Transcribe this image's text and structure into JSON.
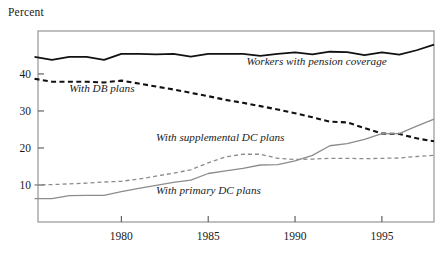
{
  "chart_data": {
    "type": "line",
    "title": "",
    "subtitle": "",
    "xlabel": "",
    "ylabel": "Percent",
    "ylim": [
      0,
      50
    ],
    "xlim": [
      1975,
      1998
    ],
    "grid": false,
    "legend_position": "inline-annotations",
    "y_ticks": [
      10,
      20,
      30,
      40
    ],
    "y_tick_labels": [
      "10",
      "20",
      "30",
      "40"
    ],
    "x_ticks": [
      1980,
      1985,
      1990,
      1995
    ],
    "x_tick_labels": [
      "1980",
      "1985",
      "1990",
      "1995"
    ],
    "x": [
      1975,
      1976,
      1977,
      1978,
      1979,
      1980,
      1981,
      1982,
      1983,
      1984,
      1985,
      1986,
      1987,
      1988,
      1989,
      1990,
      1991,
      1992,
      1993,
      1994,
      1995,
      1996,
      1997,
      1998
    ],
    "series": [
      {
        "name": "Workers with pension coverage",
        "style": "solid",
        "color": "#111111",
        "label_x": 1987.2,
        "label_y": 42.4,
        "values": [
          44.6,
          43.8,
          44.6,
          44.6,
          43.8,
          45.4,
          45.4,
          45.3,
          45.4,
          44.7,
          45.4,
          45.4,
          45.4,
          44.9,
          45.4,
          45.8,
          45.3,
          46.0,
          45.9,
          45.1,
          45.8,
          45.2,
          46.4,
          47.9
        ]
      },
      {
        "name": "With DB plans",
        "style": "dashed",
        "color": "#111111",
        "label_x": 1977.0,
        "label_y": 35.2,
        "values": [
          38.7,
          37.9,
          37.9,
          37.9,
          37.7,
          38.2,
          37.4,
          36.6,
          35.8,
          34.9,
          34.0,
          33.0,
          32.2,
          31.3,
          30.4,
          29.4,
          28.3,
          27.1,
          26.9,
          25.4,
          23.9,
          23.8,
          22.6,
          21.8
        ]
      },
      {
        "name": "With supplemental DC plans",
        "style": "dashed",
        "color": "#8c8c8c",
        "label_x": 1982.0,
        "label_y": 21.8,
        "values": [
          10.0,
          10.1,
          10.3,
          10.5,
          10.8,
          11.0,
          11.6,
          12.4,
          13.2,
          14.1,
          16.0,
          17.6,
          18.3,
          18.3,
          17.2,
          16.9,
          17.0,
          17.2,
          17.2,
          17.1,
          17.2,
          17.3,
          17.7,
          18.0
        ]
      },
      {
        "name": "With primary DC plans",
        "style": "solid",
        "color": "#8c8c8c",
        "label_x": 1982.0,
        "label_y": 7.6,
        "values": [
          6.3,
          6.3,
          7.1,
          7.2,
          7.2,
          8.2,
          9.1,
          9.9,
          10.7,
          11.3,
          13.1,
          13.8,
          14.5,
          15.4,
          15.5,
          16.5,
          18.0,
          20.6,
          21.2,
          22.3,
          23.9,
          23.9,
          25.9,
          27.8
        ]
      }
    ]
  }
}
